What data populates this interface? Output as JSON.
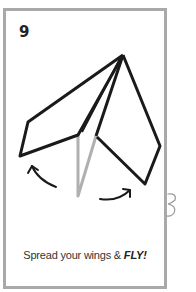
{
  "card": {
    "step_number": "9",
    "caption_text": "Spread your wings & ",
    "caption_emphasis": "FLY!",
    "border_color": "#a9a9a9"
  },
  "illustration": {
    "subject": "paper airplane with wings spread open",
    "stroke_color": "#1a1a1a",
    "keel_color": "#b0b0b0",
    "arrows": [
      "left-wing-arrow",
      "right-wing-arrow"
    ]
  }
}
